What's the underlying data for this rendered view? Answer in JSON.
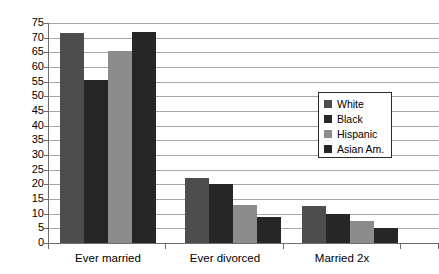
{
  "chart_data": {
    "type": "bar",
    "title": "",
    "xlabel": "",
    "ylabel": "",
    "ylim": [
      0,
      75
    ],
    "ytick_step": 5,
    "ytick_labels": [
      "75",
      "70",
      "65",
      "60",
      "55",
      "50",
      "45",
      "40",
      "35",
      "30",
      "25",
      "20",
      "15",
      "10",
      "5",
      "0"
    ],
    "grid": true,
    "legend_position": "center-right",
    "categories": [
      "Ever married",
      "Ever divorced",
      "Married 2x"
    ],
    "series": [
      {
        "name": "White",
        "color": "#4d4d4d",
        "values": [
          71.5,
          22.0,
          12.5
        ]
      },
      {
        "name": "Black",
        "color": "#262626",
        "values": [
          55.5,
          20.0,
          10.0
        ]
      },
      {
        "name": "Hispanic",
        "color": "#8c8c8c",
        "values": [
          65.5,
          13.0,
          7.5
        ]
      },
      {
        "name": "Asian Am.",
        "color": "#262626",
        "values": [
          72.0,
          9.0,
          5.0
        ]
      }
    ]
  },
  "legend": {
    "items": [
      {
        "label": "White"
      },
      {
        "label": "Black"
      },
      {
        "label": "Hispanic"
      },
      {
        "label": "Asian Am."
      }
    ]
  }
}
